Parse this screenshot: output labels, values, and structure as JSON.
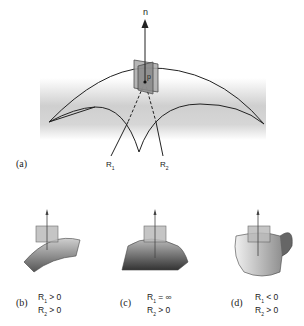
{
  "figure": {
    "panel_a": {
      "label": "(a)",
      "normal_label": "n",
      "point_label": "p",
      "radius_labels": [
        "R",
        "R"
      ],
      "radius_subs": [
        "1",
        "2"
      ]
    },
    "panels": [
      {
        "label": "(b)",
        "r1": "R",
        "r1_sub": "1",
        "r1_cond": " > 0",
        "r2": "R",
        "r2_sub": "2",
        "r2_cond": " > 0"
      },
      {
        "label": "(c)",
        "r1": "R",
        "r1_sub": "1",
        "r1_cond": " = ∞",
        "r2": "R",
        "r2_sub": "2",
        "r2_cond": " > 0"
      },
      {
        "label": "(d)",
        "r1": "R",
        "r1_sub": "1",
        "r1_cond": " < 0",
        "r2": "R",
        "r2_sub": "2",
        "r2_cond": " > 0"
      }
    ]
  }
}
